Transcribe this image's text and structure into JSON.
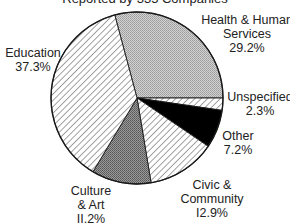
{
  "title": "Reported by 335 Companies",
  "chart_data": {
    "type": "pie",
    "title": "Reported by 335 Companies",
    "legend": "none (direct labels)",
    "slices": [
      {
        "label": "Health & Human Services",
        "value": 29.2,
        "pattern": "light-dotted",
        "color": "#bdbdbd"
      },
      {
        "label": "Unspecified",
        "value": 2.3,
        "pattern": "diagonal-hatch",
        "color": "#ffffff"
      },
      {
        "label": "Other",
        "value": 7.2,
        "pattern": "solid",
        "color": "#000000"
      },
      {
        "label": "Civic & Community",
        "value": 12.9,
        "pattern": "diagonal-hatch",
        "color": "#ffffff"
      },
      {
        "label": "Culture & Art",
        "value": 11.2,
        "pattern": "dark-dotted",
        "color": "#8a8a8a"
      },
      {
        "label": "Education",
        "value": 37.3,
        "pattern": "diagonal-hatch",
        "color": "#ffffff"
      }
    ],
    "start_angle_deg": -105,
    "direction": "clockwise"
  },
  "labels": {
    "health": {
      "line1": "Health & Human",
      "line2": "Services",
      "value": "29.2%"
    },
    "unspecified": {
      "line1": "Unspecified",
      "value": "2.3%"
    },
    "other": {
      "line1": "Other",
      "value": "7.2%"
    },
    "civic": {
      "line1": "Civic &",
      "line2": "Community",
      "value": "I2.9%"
    },
    "culture": {
      "line1": "Culture",
      "line2": "& Art",
      "value": "II.2%"
    },
    "education": {
      "line1": "Education",
      "value": "37.3%"
    }
  }
}
